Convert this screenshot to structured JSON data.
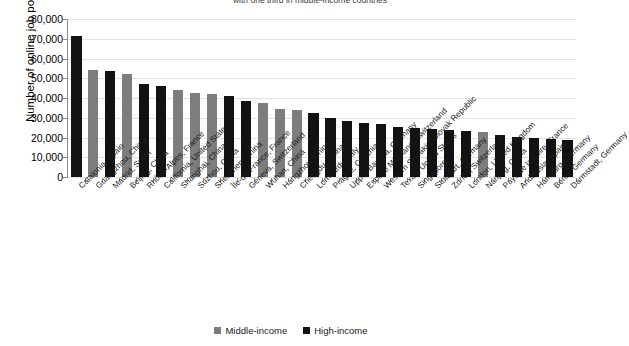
{
  "chart_data": {
    "type": "bar",
    "title": "with one third in middle-income countries",
    "xlabel": "",
    "ylabel": "Number of online job postings",
    "ylim": [
      0,
      80000
    ],
    "ytick_step": 10000,
    "ytick_labels": [
      "80,000",
      "70,000",
      "60,000",
      "50,000",
      "40,000",
      "30,000",
      "20,000",
      "10,000",
      "0"
    ],
    "grid": true,
    "legend_position": "bottom-center",
    "legend": [
      {
        "name": "Middle-income",
        "color": "#7d7d7d"
      },
      {
        "name": "High-income",
        "color": "#121212"
      }
    ],
    "categories": [
      "Catalonia, Spain",
      "Guangzhou, China",
      "Madrid, Spain",
      "Beijing, China",
      "Rhône-Alpes, France",
      "California, United States",
      "Shanghai, China",
      "Suzhou, China",
      "Shenzhen, China",
      "Île-de-France, France",
      "Geneva, Switzerland",
      "Wuhan, China",
      "Hangzhou, China",
      "Chengdu, China",
      "Lombardy, Italy",
      "Prague, Czechia",
      "Upper Bavaria, Germany",
      "Espace Mitteland, Switzerland",
      "Western Slovakia, Slovak Republic",
      "Texas, United States",
      "Singapore",
      "Stuttgart, Germany",
      "Zurich, Switzerland",
      "London, United Kingdom",
      "Nanjing, China",
      "Pays de la Loire, France",
      "Andalusia, Spain",
      "Hamburg, Germany",
      "Berlin, Germany",
      "Darmstadt, Germany"
    ],
    "values": [
      71500,
      54300,
      53700,
      52000,
      47000,
      46200,
      44200,
      42700,
      41800,
      41000,
      38400,
      37700,
      34500,
      33900,
      32300,
      29800,
      28500,
      27400,
      26700,
      25300,
      24700,
      24100,
      23700,
      23300,
      22900,
      21500,
      20200,
      19800,
      19400,
      18600
    ],
    "groups": [
      "High-income",
      "Middle-income",
      "High-income",
      "Middle-income",
      "High-income",
      "High-income",
      "Middle-income",
      "Middle-income",
      "Middle-income",
      "High-income",
      "High-income",
      "Middle-income",
      "Middle-income",
      "Middle-income",
      "High-income",
      "High-income",
      "High-income",
      "High-income",
      "High-income",
      "High-income",
      "High-income",
      "High-income",
      "High-income",
      "High-income",
      "Middle-income",
      "High-income",
      "High-income",
      "High-income",
      "High-income",
      "High-income"
    ]
  }
}
